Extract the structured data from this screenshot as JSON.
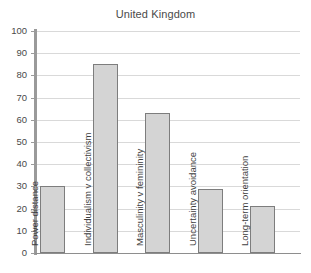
{
  "chart_data": {
    "type": "bar",
    "title": "United Kingdom",
    "xlabel": "",
    "ylabel": "",
    "ylim": [
      0,
      100
    ],
    "ytick_labels": [
      "100",
      "90",
      "80",
      "70",
      "60",
      "50",
      "40",
      "30",
      "20",
      "10",
      "0"
    ],
    "ytick_values": [
      100,
      90,
      80,
      70,
      60,
      50,
      40,
      30,
      20,
      10,
      0
    ],
    "grid": true,
    "legend": "none",
    "categories": [
      "Power distance",
      "Individualism v collectivism",
      "Masculinity v femininity",
      "Uncertainty avoidance",
      "Long-term orientation"
    ],
    "values": [
      30,
      85,
      63,
      29,
      21
    ],
    "bar_fill_color": "#d4d4d4",
    "bar_border_color": "#7d7d7d",
    "gridline_color": "#d9d9d9",
    "axis_color": "#9a9a9a",
    "label_orientation": "vertical-bottom-to-top",
    "label_placement": "inside-bar-from-baseline"
  }
}
